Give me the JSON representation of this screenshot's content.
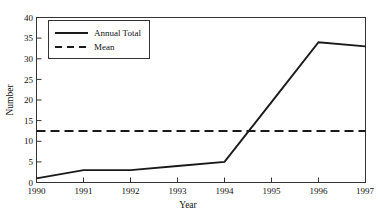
{
  "chart_data": {
    "type": "line",
    "title": "",
    "xlabel": "Year",
    "ylabel": "Number",
    "categories": [
      "1990",
      "1991",
      "1992",
      "1993",
      "1994",
      "1995",
      "1996",
      "1997"
    ],
    "x": [
      1990,
      1991,
      1992,
      1993,
      1994,
      1995,
      1996,
      1997
    ],
    "xlim": [
      1990,
      1997
    ],
    "ylim": [
      0,
      40
    ],
    "ytick_labels": [
      "0",
      "5",
      "10",
      "15",
      "20",
      "25",
      "30",
      "35",
      "40"
    ],
    "yticks": [
      0,
      5,
      10,
      15,
      20,
      25,
      30,
      35,
      40
    ],
    "grid": false,
    "legend_position": "top-left",
    "series": [
      {
        "name": "Annual Total",
        "style": "solid",
        "color": "#1a1a1a",
        "values": [
          1,
          3,
          3,
          4,
          5,
          19.5,
          34,
          33
        ]
      },
      {
        "name": "Mean",
        "style": "dashed",
        "color": "#1a1a1a",
        "constant_value": 12.5,
        "values": [
          12.5,
          12.5,
          12.5,
          12.5,
          12.5,
          12.5,
          12.5,
          12.5
        ]
      }
    ],
    "legend_entries": [
      {
        "label": "Annual Total",
        "style": "solid"
      },
      {
        "label": "Mean",
        "style": "dashed"
      }
    ]
  }
}
